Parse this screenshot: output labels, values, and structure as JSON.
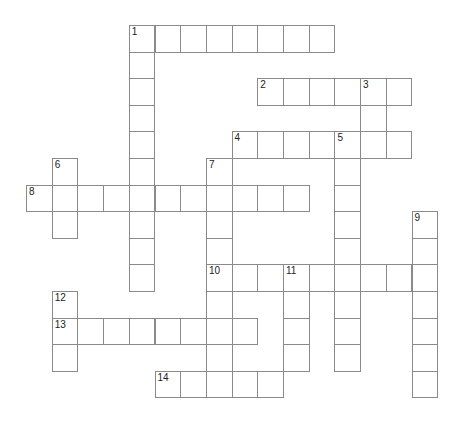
{
  "puzzle": {
    "type": "crossword",
    "grid": {
      "origin_x": 26,
      "origin_y": 25,
      "cell_w": 25.7,
      "cell_h": 26.6,
      "border_color": "#8a8a8a"
    },
    "entries": [
      {
        "number": "1",
        "direction": "across",
        "row": 0,
        "col": 4,
        "length": 8
      },
      {
        "number": "1",
        "direction": "down",
        "row": 0,
        "col": 4,
        "length": 10
      },
      {
        "number": "2",
        "direction": "across",
        "row": 2,
        "col": 9,
        "length": 6
      },
      {
        "number": "3",
        "direction": "down",
        "row": 2,
        "col": 13,
        "length": 3
      },
      {
        "number": "4",
        "direction": "across",
        "row": 4,
        "col": 8,
        "length": 7
      },
      {
        "number": "5",
        "direction": "down",
        "row": 4,
        "col": 12,
        "length": 9
      },
      {
        "number": "6",
        "direction": "down",
        "row": 5,
        "col": 1,
        "length": 3
      },
      {
        "number": "7",
        "direction": "down",
        "row": 5,
        "col": 7,
        "length": 9
      },
      {
        "number": "8",
        "direction": "across",
        "row": 6,
        "col": 0,
        "length": 11
      },
      {
        "number": "9",
        "direction": "down",
        "row": 7,
        "col": 15,
        "length": 7
      },
      {
        "number": "10",
        "direction": "across",
        "row": 9,
        "col": 7,
        "length": 9
      },
      {
        "number": "11",
        "direction": "down",
        "row": 9,
        "col": 10,
        "length": 4
      },
      {
        "number": "12",
        "direction": "down",
        "row": 10,
        "col": 1,
        "length": 3
      },
      {
        "number": "13",
        "direction": "across",
        "row": 11,
        "col": 1,
        "length": 8
      },
      {
        "number": "14",
        "direction": "across",
        "row": 13,
        "col": 5,
        "length": 5
      }
    ]
  }
}
